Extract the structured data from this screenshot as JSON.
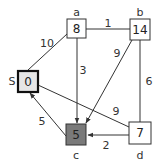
{
  "diagram": {
    "type": "weighted-directed-graph",
    "colors": {
      "node_border": "#333333",
      "source_fill": "#e6e6e6",
      "current_fill": "#7a7a7a",
      "default_fill": "#ffffff"
    },
    "nodes": [
      {
        "id": "S",
        "label": "S",
        "value": "0",
        "state": "source"
      },
      {
        "id": "a",
        "label": "a",
        "value": "8",
        "state": "default"
      },
      {
        "id": "b",
        "label": "b",
        "value": "14",
        "state": "default"
      },
      {
        "id": "c",
        "label": "c",
        "value": "5",
        "state": "current"
      },
      {
        "id": "d",
        "label": "d",
        "value": "7",
        "state": "default"
      }
    ],
    "edges": [
      {
        "from": "S",
        "to": "a",
        "weight": "10",
        "directed": false
      },
      {
        "from": "a",
        "to": "b",
        "weight": "1",
        "directed": false
      },
      {
        "from": "a",
        "to": "c",
        "weight": "3",
        "directed": true
      },
      {
        "from": "b",
        "to": "c",
        "weight": "9",
        "directed": true
      },
      {
        "from": "b",
        "to": "d",
        "weight": "6",
        "directed": false
      },
      {
        "from": "S",
        "to": "d",
        "weight": "9",
        "directed": false
      },
      {
        "from": "c",
        "to": "S",
        "weight": "5",
        "directed": true
      },
      {
        "from": "d",
        "to": "c",
        "weight": "2",
        "directed": true
      }
    ]
  }
}
